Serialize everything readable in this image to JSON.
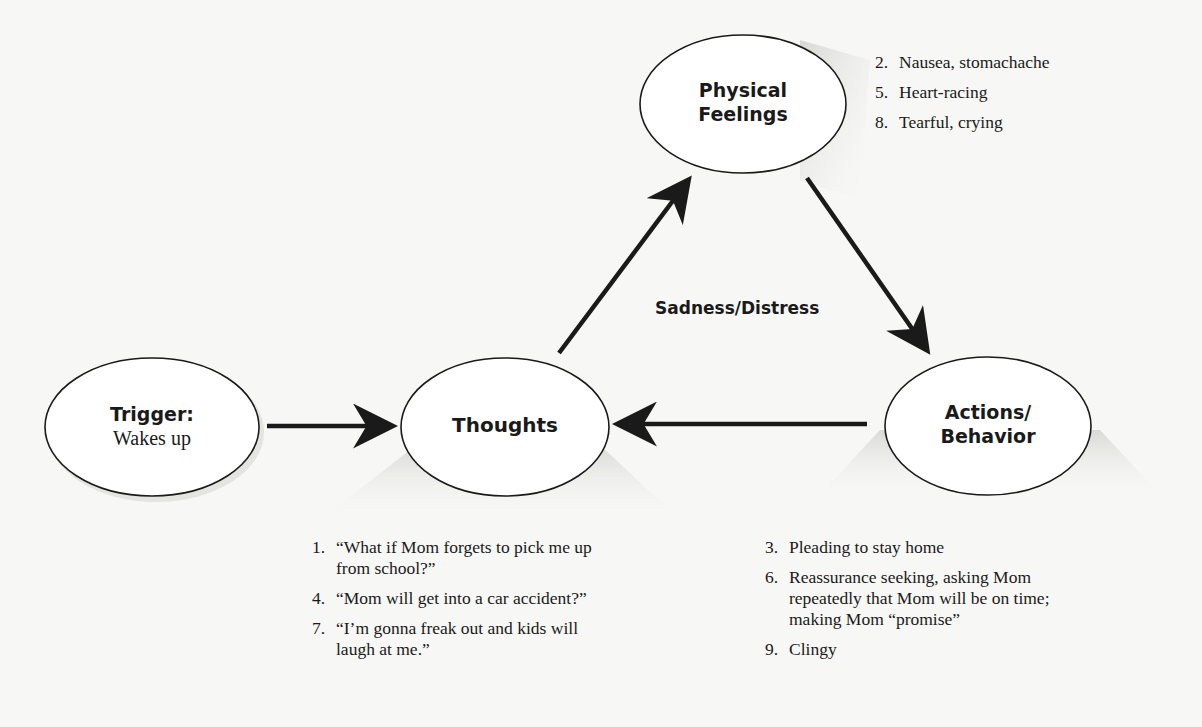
{
  "diagram": {
    "nodes": {
      "trigger": {
        "title": "Trigger:",
        "subtitle": "Wakes up"
      },
      "thoughts": {
        "title": "Thoughts"
      },
      "physical": {
        "title_line1": "Physical",
        "title_line2": "Feelings"
      },
      "actions": {
        "title_line1": "Actions/",
        "title_line2": "Behavior"
      }
    },
    "center_label": "Sadness/Distress",
    "edges": [
      {
        "from": "trigger",
        "to": "thoughts"
      },
      {
        "from": "thoughts",
        "to": "physical"
      },
      {
        "from": "physical",
        "to": "actions"
      },
      {
        "from": "actions",
        "to": "thoughts"
      }
    ],
    "physical_list": [
      {
        "num": "2.",
        "text": "Nausea, stomachache"
      },
      {
        "num": "5.",
        "text": "Heart-racing"
      },
      {
        "num": "8.",
        "text": "Tearful, crying"
      }
    ],
    "thoughts_list": [
      {
        "num": "1.",
        "text": "“What if Mom forgets to pick me up from school?”"
      },
      {
        "num": "4.",
        "text": "“Mom will get into a car accident?”"
      },
      {
        "num": "7.",
        "text": "“I’m gonna freak out and kids will laugh at me.”"
      }
    ],
    "actions_list": [
      {
        "num": "3.",
        "text": "Pleading to stay home"
      },
      {
        "num": "6.",
        "text": "Reassurance seeking, asking Mom repeatedly that Mom will be on time; making Mom “promise”"
      },
      {
        "num": "9.",
        "text": "Clingy"
      }
    ],
    "colors": {
      "stroke": "#1a1a1a",
      "background": "#f7f7f5",
      "shadow": "#d9d9d6"
    }
  }
}
